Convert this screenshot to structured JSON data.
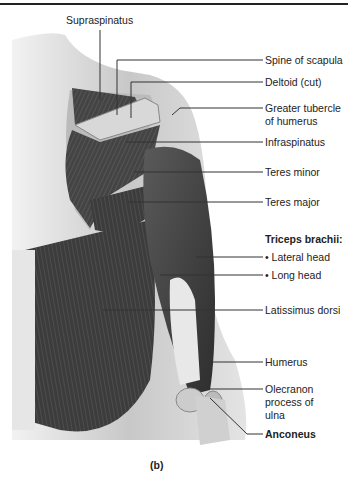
{
  "figure": {
    "caption": "(b)",
    "labels": {
      "supraspinatus": "Supraspinatus",
      "spine_of_scapula": "Spine of scapula",
      "deltoid_cut": "Deltoid (cut)",
      "greater_tubercle_1": "Greater tubercle",
      "greater_tubercle_2": "of humerus",
      "infraspinatus": "Infraspinatus",
      "teres_minor": "Teres minor",
      "teres_major": "Teres major",
      "triceps_header": "Triceps brachii:",
      "lateral_head": "• Lateral head",
      "long_head": "• Long head",
      "latissimus_dorsi": "Latissimus dorsi",
      "humerus": "Humerus",
      "olecranon_1": "Olecranon",
      "olecranon_2": "process of",
      "olecranon_3": "ulna",
      "anconeus": "Anconeus"
    }
  }
}
